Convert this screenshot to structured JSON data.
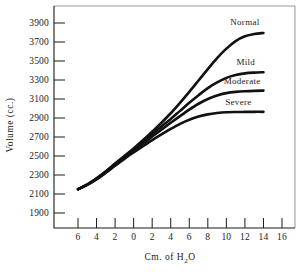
{
  "chart_data": {
    "type": "line",
    "title": "",
    "xlabel": "Cm. of H2O",
    "xlabel_parts": {
      "pre": "Cm. of H",
      "sub": "2",
      "post": "O"
    },
    "ylabel": "Volume (cc.)",
    "xticks": [
      "6",
      "4",
      "2",
      "0",
      "2",
      "4",
      "6",
      "8",
      "10",
      "12",
      "14",
      "16"
    ],
    "xtick_values": [
      -6,
      -4,
      -2,
      0,
      2,
      4,
      6,
      8,
      10,
      12,
      14,
      16
    ],
    "yticks": [
      "1900",
      "2100",
      "2300",
      "2500",
      "2700",
      "2900",
      "3100",
      "3300",
      "3500",
      "3700",
      "3900"
    ],
    "ytick_values": [
      1900,
      2100,
      2300,
      2500,
      2700,
      2900,
      3100,
      3300,
      3500,
      3700,
      3900
    ],
    "xlim": [
      -7,
      17
    ],
    "ylim": [
      1800,
      4000
    ],
    "grid": false,
    "legend_position": "inline-curve-end-labels",
    "line_color": "#111111",
    "axis_color": "#1a1a1a",
    "background_color": "#ffffff",
    "series": [
      {
        "name": "Normal",
        "label_x": 12.0,
        "label_y": 3880,
        "x": [
          -6,
          -5,
          -4,
          -3,
          -2,
          -1,
          0,
          1,
          2,
          3,
          4,
          5,
          6,
          7,
          8,
          9,
          10,
          11,
          12,
          13,
          14
        ],
        "values": [
          2150,
          2200,
          2265,
          2340,
          2420,
          2500,
          2580,
          2665,
          2755,
          2850,
          2950,
          3060,
          3175,
          3295,
          3415,
          3530,
          3630,
          3710,
          3760,
          3785,
          3795
        ]
      },
      {
        "name": "Mild",
        "label_x": 12.1,
        "label_y": 3460,
        "x": [
          -6,
          -5,
          -4,
          -3,
          -2,
          -1,
          0,
          1,
          2,
          3,
          4,
          5,
          6,
          7,
          8,
          9,
          10,
          11,
          12,
          13,
          14
        ],
        "values": [
          2150,
          2200,
          2262,
          2335,
          2415,
          2495,
          2572,
          2650,
          2730,
          2810,
          2890,
          2975,
          3060,
          3140,
          3215,
          3275,
          3322,
          3352,
          3370,
          3378,
          3382
        ]
      },
      {
        "name": "Moderate",
        "label_x": 11.7,
        "label_y": 3260,
        "x": [
          -6,
          -5,
          -4,
          -3,
          -2,
          -1,
          0,
          1,
          2,
          3,
          4,
          5,
          6,
          7,
          8,
          9,
          10,
          11,
          12,
          13,
          14
        ],
        "values": [
          2150,
          2198,
          2258,
          2330,
          2408,
          2485,
          2558,
          2632,
          2705,
          2778,
          2850,
          2920,
          2988,
          3050,
          3100,
          3138,
          3162,
          3175,
          3182,
          3186,
          3188
        ]
      },
      {
        "name": "Severe",
        "label_x": 11.3,
        "label_y": 3040,
        "x": [
          -6,
          -5,
          -4,
          -3,
          -2,
          -1,
          0,
          1,
          2,
          3,
          4,
          5,
          6,
          7,
          8,
          9,
          10,
          11,
          12,
          13,
          14
        ],
        "values": [
          2150,
          2196,
          2254,
          2324,
          2398,
          2470,
          2538,
          2604,
          2668,
          2728,
          2785,
          2838,
          2882,
          2915,
          2938,
          2952,
          2960,
          2963,
          2964,
          2965,
          2965
        ]
      }
    ]
  }
}
